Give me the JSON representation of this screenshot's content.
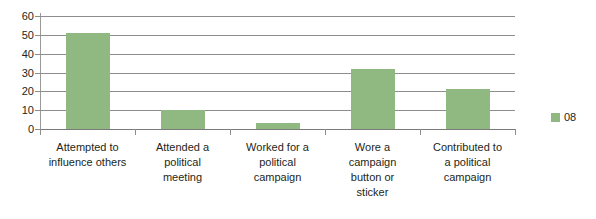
{
  "chart_data": {
    "type": "bar",
    "title": "",
    "xlabel": "",
    "ylabel": "",
    "categories": [
      "Attempted to influence others",
      "Attended a political meeting",
      "Worked for a political campaign",
      "Wore a campaign button or sticker",
      "Contributed to a political campaign"
    ],
    "category_lines": [
      [
        "Attempted to",
        "influence others"
      ],
      [
        "Attended a",
        "political",
        "meeting"
      ],
      [
        "Worked for a",
        "political",
        "campaign"
      ],
      [
        "Wore a",
        "campaign",
        "button or",
        "sticker"
      ],
      [
        "Contributed to",
        "a political",
        "campaign"
      ]
    ],
    "series": [
      {
        "name": "08",
        "values": [
          51,
          10,
          3,
          32,
          21
        ],
        "color": "#8fb981"
      }
    ],
    "values": [
      51,
      10,
      3,
      32,
      21
    ],
    "ylim": [
      0,
      60
    ],
    "yticks": [
      0,
      10,
      20,
      30,
      40,
      50,
      60
    ],
    "ytick_labels": [
      "0",
      "10",
      "20",
      "30",
      "40",
      "50",
      "60"
    ],
    "grid": true,
    "grid_axis": "y",
    "legend": {
      "position": "right",
      "entries": [
        {
          "label": "08",
          "color": "#8fb981"
        }
      ]
    },
    "colors": {
      "bar": "#8fb981",
      "gridline": "#8d8d8d",
      "axis": "#9a9a9a",
      "text": "#231f20",
      "background": "#ffffff"
    }
  }
}
